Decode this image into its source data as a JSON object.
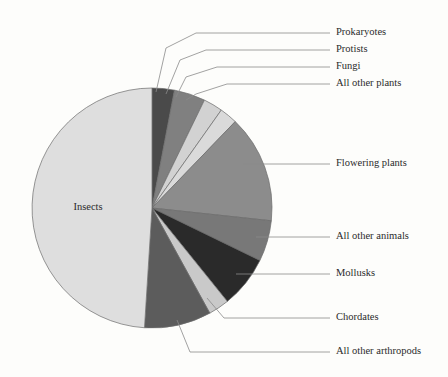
{
  "chart_data": {
    "type": "pie",
    "title": "",
    "subtitle": "",
    "xlabel": "",
    "ylabel": "",
    "legend_position": "callout-labels-right",
    "grid": false,
    "note": "Proportions of described species on Earth; slices ordered clockwise from 12 o'clock",
    "categories": [
      "Prokaryotes",
      "Protists",
      "Fungi",
      "All other plants",
      "Flowering plants",
      "All other animals",
      "Mollusks",
      "Chordates",
      "All other arthropods",
      "Insects"
    ],
    "values": [
      3.0,
      4.2,
      2.6,
      2.4,
      14.5,
      5.5,
      7.0,
      2.8,
      9.0,
      49.0
    ],
    "colors": [
      "#4a4a4a",
      "#808080",
      "#d2d2d2",
      "#dadada",
      "#8c8c8c",
      "#787878",
      "#2a2a2a",
      "#c9c9c9",
      "#5c5c5c",
      "#dedede"
    ],
    "slices": [
      {
        "label": "Prokaryotes",
        "value": 3.0,
        "color": "#4a4a4a",
        "label_placement": "callout-top-right"
      },
      {
        "label": "Protists",
        "value": 4.2,
        "color": "#808080",
        "label_placement": "callout-top-right"
      },
      {
        "label": "Fungi",
        "value": 2.6,
        "color": "#d2d2d2",
        "label_placement": "callout-top-right"
      },
      {
        "label": "All other plants",
        "value": 2.4,
        "color": "#dadada",
        "label_placement": "callout-top-right"
      },
      {
        "label": "Flowering plants",
        "value": 14.5,
        "color": "#8c8c8c",
        "label_placement": "callout-right"
      },
      {
        "label": "All other animals",
        "value": 5.5,
        "color": "#787878",
        "label_placement": "callout-right"
      },
      {
        "label": "Mollusks",
        "value": 7.0,
        "color": "#2a2a2a",
        "label_placement": "callout-right"
      },
      {
        "label": "Chordates",
        "value": 2.8,
        "color": "#c9c9c9",
        "label_placement": "callout-bottom-right"
      },
      {
        "label": "All other arthropods",
        "value": 9.0,
        "color": "#5c5c5c",
        "label_placement": "callout-bottom-right"
      },
      {
        "label": "Insects",
        "value": 49.0,
        "color": "#dedede",
        "label_placement": "inside"
      }
    ]
  },
  "labels": {
    "prokaryotes": "Prokaryotes",
    "protists": "Protists",
    "fungi": "Fungi",
    "all_other_plants": "All other plants",
    "flowering_plants": "Flowering plants",
    "all_other_animals": "All other animals",
    "mollusks": "Mollusks",
    "chordates": "Chordates",
    "all_other_arthropods": "All other arthropods",
    "insects": "Insects"
  },
  "style": {
    "background": "#fdfdfb",
    "slice_outline": "#6b6b6b",
    "leader_line": "#8a8a8a",
    "text_color": "#2b2b2b"
  }
}
